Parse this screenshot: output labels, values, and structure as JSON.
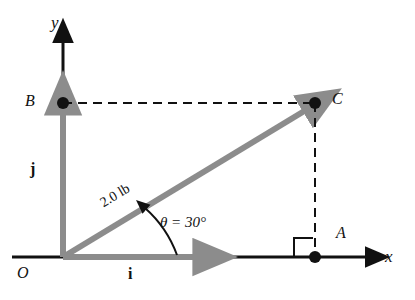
{
  "figure": {
    "colors": {
      "axis": "#111111",
      "vector": "#8c8c8c",
      "dashed": "#111111",
      "text": "#111111",
      "background": "#ffffff"
    },
    "axes": {
      "x_label": "x",
      "y_label": "y",
      "origin_label": "O"
    },
    "points": [
      {
        "id": "A",
        "label": "A",
        "x": 315,
        "y": 257
      },
      {
        "id": "B",
        "label": "B",
        "x": 63,
        "y": 103
      },
      {
        "id": "C",
        "label": "C",
        "x": 315,
        "y": 103
      },
      {
        "id": "O",
        "label": "O",
        "x": 63,
        "y": 257
      }
    ],
    "unit_vectors": {
      "i_label": "i",
      "j_label": "j"
    },
    "vector": {
      "magnitude_label": "2.0 lb",
      "magnitude_value": 2.0,
      "magnitude_units": "lb",
      "angle_label": "θ = 30°",
      "angle_symbol": "θ",
      "angle_value": 30,
      "angle_units": "degrees"
    },
    "markers": {
      "right_angle": "right-angle-marker"
    }
  }
}
